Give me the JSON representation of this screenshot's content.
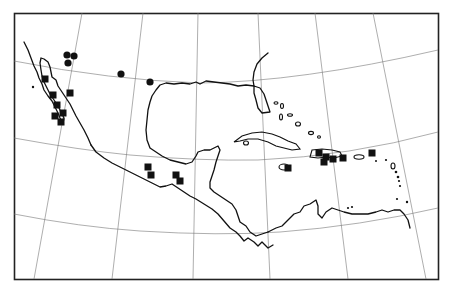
{
  "map": {
    "type": "point distribution map",
    "region": "Mexico, Central America and the Caribbean",
    "colors": {
      "ink": "#111111",
      "grid": "#777777",
      "background": "#ffffff"
    },
    "legend": {},
    "markers": {
      "circles": [
        {
          "x": 67,
          "y": 55
        },
        {
          "x": 74,
          "y": 56
        },
        {
          "x": 68,
          "y": 63
        },
        {
          "x": 121,
          "y": 74
        },
        {
          "x": 150,
          "y": 82
        }
      ],
      "squares": [
        {
          "x": 45,
          "y": 79
        },
        {
          "x": 70,
          "y": 93
        },
        {
          "x": 53,
          "y": 95
        },
        {
          "x": 57,
          "y": 105
        },
        {
          "x": 63,
          "y": 113
        },
        {
          "x": 55,
          "y": 116
        },
        {
          "x": 61,
          "y": 122
        },
        {
          "x": 148,
          "y": 167
        },
        {
          "x": 151,
          "y": 175
        },
        {
          "x": 176,
          "y": 175
        },
        {
          "x": 180,
          "y": 181
        },
        {
          "x": 288,
          "y": 168
        },
        {
          "x": 319,
          "y": 153
        },
        {
          "x": 326,
          "y": 157
        },
        {
          "x": 333,
          "y": 159
        },
        {
          "x": 324,
          "y": 162
        },
        {
          "x": 343,
          "y": 158
        },
        {
          "x": 372,
          "y": 153
        }
      ]
    }
  }
}
